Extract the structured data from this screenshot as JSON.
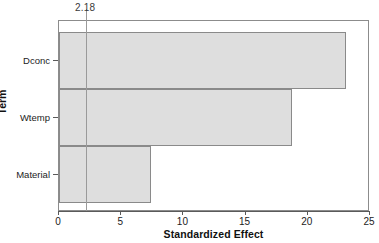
{
  "chart_data": {
    "type": "bar",
    "orientation": "horizontal",
    "title": "",
    "xlabel": "Standardized Effect",
    "ylabel": "Term",
    "categories": [
      "Dconc",
      "Wtemp",
      "Material"
    ],
    "values": [
      23.1,
      18.7,
      7.4
    ],
    "xlim": [
      0,
      25
    ],
    "xticks": [
      0,
      5,
      10,
      15,
      20,
      25
    ],
    "xtick_labels": [
      "0",
      "5",
      "10",
      "15",
      "20",
      "25"
    ],
    "grid": false,
    "legend": "none",
    "reference_line": {
      "value": 2.18,
      "label": "2.18"
    },
    "colors": {
      "bar_fill": "#dedede",
      "bar_border": "#8a8a8a",
      "axis": "#5a5a5a",
      "frame": "#8c8c8c",
      "reference_line": "#9a9a9a",
      "text": "#1c1c1c",
      "background": "#ffffff"
    }
  }
}
